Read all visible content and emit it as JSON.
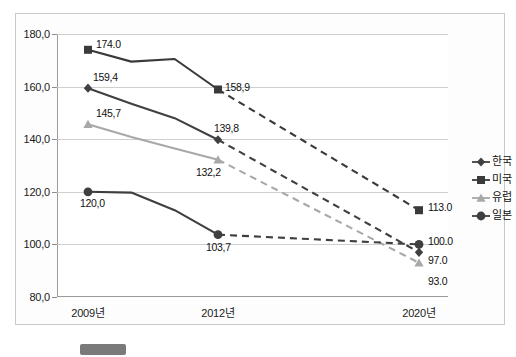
{
  "chart_data": {
    "type": "line",
    "title": "",
    "xlabel": "",
    "ylabel": "",
    "categories": [
      "2009년",
      "2012년",
      "2020년"
    ],
    "ylim": [
      80.0,
      180.0
    ],
    "ytick_labels": [
      "180,0",
      "160,0",
      "140,0",
      "120,0",
      "100,0",
      "80,0"
    ],
    "ytick_values": [
      180.0,
      160.0,
      140.0,
      120.0,
      100.0,
      80.0
    ],
    "grid": true,
    "legend_position": "right",
    "series": [
      {
        "name": "한국",
        "marker": "diamond",
        "color": "#404040",
        "values": [
          159.4,
          139.8,
          97.0
        ],
        "labels": [
          "159,4",
          "139,8",
          "97.0"
        ],
        "solid_path": [
          159.4,
          153.5,
          148.0,
          139.8
        ],
        "dashed_to_2020": true
      },
      {
        "name": "미국",
        "marker": "square",
        "color": "#3a3a3a",
        "values": [
          174.0,
          158.9,
          113.0
        ],
        "labels": [
          "174.0",
          "158,9",
          "113.0"
        ],
        "solid_path": [
          174.0,
          169.5,
          170.5,
          158.9
        ],
        "dashed_to_2020": true
      },
      {
        "name": "유럽",
        "marker": "triangle",
        "color": "#a8a8a8",
        "values": [
          145.7,
          132.2,
          93.0
        ],
        "labels": [
          "145,7",
          "132,2",
          "93.0"
        ],
        "solid_path": [
          145.7,
          140.8,
          136.5,
          132.2
        ],
        "dashed_to_2020": true
      },
      {
        "name": "일본",
        "marker": "circle",
        "color": "#3f3f3f",
        "values": [
          120.0,
          103.7,
          100.0
        ],
        "labels": [
          "120,0",
          "103,7",
          "100.0"
        ],
        "solid_path": [
          120.0,
          119.7,
          113.0,
          103.7
        ],
        "dashed_to_2020": true
      }
    ]
  },
  "axis": {
    "y_labels": [
      "180,0",
      "160,0",
      "140,0",
      "120,0",
      "100,0",
      "80,0"
    ],
    "x_labels": [
      "2009년",
      "2012년",
      "2020년"
    ]
  },
  "legend": {
    "items": [
      {
        "label": "한국",
        "marker": "diamond-marker",
        "color": "#404040"
      },
      {
        "label": "미국",
        "marker": "square-marker",
        "color": "#3a3a3a"
      },
      {
        "label": "유럽",
        "marker": "triangle-marker",
        "color": "#a8a8a8"
      },
      {
        "label": "일본",
        "marker": "circle-marker",
        "color": "#3f3f3f"
      }
    ]
  },
  "point_labels": {
    "kr_2009": "159,4",
    "kr_2012": "139,8",
    "kr_2020": "97.0",
    "us_2009": "174.0",
    "us_2012": "158,9",
    "us_2020": "113.0",
    "eu_2009": "145,7",
    "eu_2012": "132,2",
    "eu_2020": "93.0",
    "jp_2009": "120,0",
    "jp_2012": "103,7",
    "jp_2020": "100.0"
  },
  "caption": {
    "text": ""
  }
}
